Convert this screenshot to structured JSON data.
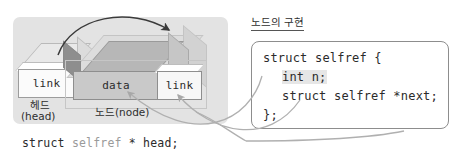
{
  "diagram": {
    "panel": {
      "head": {
        "cell_label": "link",
        "caption_ko": "헤드",
        "caption_en": "(head)"
      },
      "node": {
        "data_label": "data",
        "link_label": "link",
        "caption": "노드(node)"
      }
    },
    "bottom_code": {
      "prefix": "struct ",
      "type_name": "selfref",
      "suffix": " * head;"
    },
    "code_panel": {
      "title": "노드의 구현",
      "lines": [
        "struct selfref {",
        "int n;",
        "struct selfref *next;",
        "};"
      ]
    },
    "colors": {
      "panel_bg": "#e3e3e3",
      "data_cell": "#c9c9c9",
      "highlight_strong": "#c9c9c9",
      "highlight_light": "#e6e6e6",
      "arrow_dark": "#3a3a3a",
      "arrow_light": "#b0b0b0",
      "code_border": "#8d8d8d"
    }
  }
}
